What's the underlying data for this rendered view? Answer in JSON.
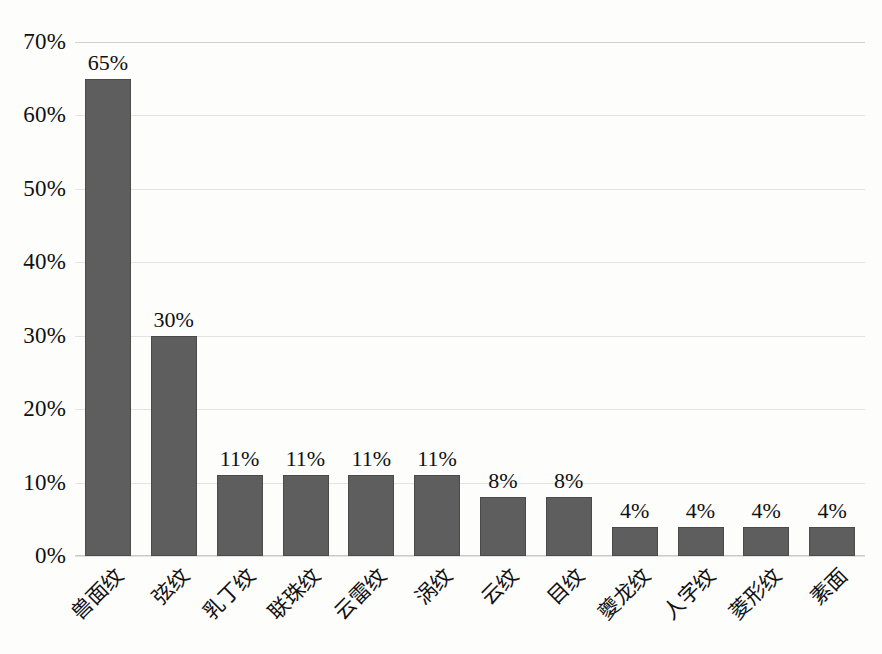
{
  "chart_data": {
    "type": "bar",
    "title": "",
    "subtitle": "",
    "xlabel": "",
    "ylabel": "",
    "ylim": [
      0,
      70
    ],
    "y_tick_step": 10,
    "grid": true,
    "legend": false,
    "legend_position": "none",
    "orientation": "vertical",
    "value_suffix": "%",
    "bar_color": "#5e5e5e",
    "bar_edge_color": "#4a4a4a",
    "gridline_color": "#e3e3e3",
    "plot_background": "#fdfdfc",
    "categories": [
      "兽面纹",
      "弦纹",
      "乳丁纹",
      "联珠纹",
      "云雷纹",
      "涡纹",
      "云纹",
      "目纹",
      "夔龙纹",
      "人字纹",
      "菱形纹",
      "素面"
    ],
    "values": [
      65,
      30,
      11,
      11,
      11,
      11,
      8,
      8,
      4,
      4,
      4,
      4
    ],
    "data_labels": [
      "65%",
      "30%",
      "11%",
      "11%",
      "11%",
      "11%",
      "8%",
      "8%",
      "4%",
      "4%",
      "4%",
      "4%"
    ],
    "y_tick_labels": [
      "0%",
      "10%",
      "20%",
      "30%",
      "40%",
      "50%",
      "60%",
      "70%"
    ],
    "y_tick_values": [
      0,
      10,
      20,
      30,
      40,
      50,
      60,
      70
    ]
  }
}
